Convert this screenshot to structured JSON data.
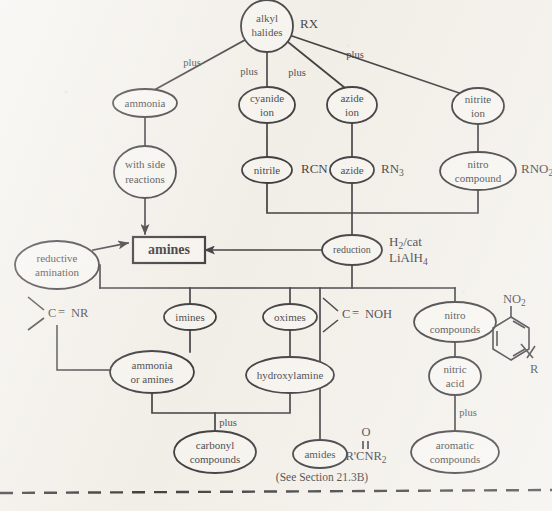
{
  "diagram": {
    "nodes": {
      "alkyl_halides": "alkyl\nhalides",
      "alkyl_halides_l1": "alkyl",
      "alkyl_halides_l2": "halides",
      "ammonia": "ammonia",
      "cyanide_ion_l1": "cyanide",
      "cyanide_ion_l2": "ion",
      "azide_ion_l1": "azide",
      "azide_ion_l2": "ion",
      "nitrite_ion_l1": "nitrite",
      "nitrite_ion_l2": "ion",
      "side_reactions_l1": "with side",
      "side_reactions_l2": "reactions",
      "nitrile": "nitrile",
      "azide": "azide",
      "nitro_compound_l1": "nitro",
      "nitro_compound_l2": "compound",
      "amines": "amines",
      "reduction": "reduction",
      "reductive_amination_l1": "reductive",
      "reductive_amination_l2": "amination",
      "imines": "imines",
      "oximes": "oximes",
      "nitro_compounds_l1": "nitro",
      "nitro_compounds_l2": "compounds",
      "ammonia_or_amines_l1": "ammonia",
      "ammonia_or_amines_l2": "or amines",
      "hydroxylamine": "hydroxylamine",
      "nitric_acid_l1": "nitric",
      "nitric_acid_l2": "acid",
      "carbonyl_compounds_l1": "carbonyl",
      "carbonyl_compounds_l2": "compounds",
      "amides": "amides",
      "aromatic_compounds_l1": "aromatic",
      "aromatic_compounds_l2": "compounds"
    },
    "edge_labels": {
      "plus_ammonia": "plus",
      "plus_cyanide": "plus",
      "plus_azide": "plus",
      "plus_nitrite": "plus",
      "plus_carbonyl": "plus",
      "plus_aromatic": "plus"
    },
    "formulas": {
      "rx": "RX",
      "rcn": "RCN",
      "rn3_base": "RN",
      "rn3_sub": "3",
      "rno2_base": "RNO",
      "rno2_sub": "2",
      "reagent_h2_base": "H",
      "reagent_h2_sub": "2",
      "reagent_h2_tail": "/cat",
      "reagent_lialh4_base": "LiAlH",
      "reagent_lialh4_sub": "4",
      "imine_group": "C",
      "imine_bond": "=",
      "imine_tail": "NR",
      "oxime_group": "C",
      "oxime_bond": "=",
      "oxime_tail": "NOH",
      "amide_oxygen": "O",
      "amide_double_bond": "||",
      "amide_formula": "R'CNR",
      "amide_sub": "2",
      "aryl_nitro_base": "NO",
      "aryl_nitro_sub": "2",
      "aryl_r": "R"
    },
    "notes": {
      "section_ref": "(See  Section 21.3B)"
    },
    "colors": {
      "ink": "#17151a",
      "paper": "#f2efe9",
      "node_fill": "#f7f5f0"
    }
  }
}
